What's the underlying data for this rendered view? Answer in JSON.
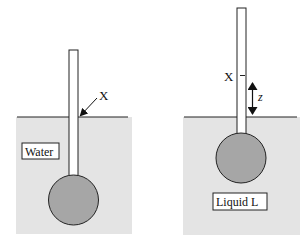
{
  "colors": {
    "liquid_fill": "#e4e4e4",
    "bulb_fill": "#a6a6a6",
    "stroke": "#222222",
    "tube_fill": "#ffffff",
    "label_bg": "#ffffff"
  },
  "left_panel": {
    "liquid_label": "Water",
    "mark_label": "X"
  },
  "right_panel": {
    "liquid_label": "Liquid L",
    "mark_label": "X",
    "height_label": "z"
  }
}
